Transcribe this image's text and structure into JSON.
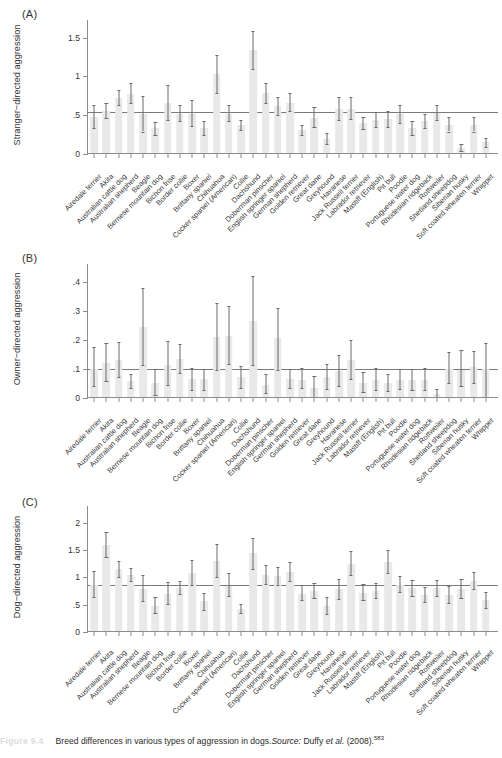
{
  "caption": {
    "figure_number": "Figure 9.4",
    "text_before_source": "Breed differences in various types of aggression in dogs.",
    "source_label": "Source:",
    "source_text": " Duffy ",
    "source_italic": "et al.",
    "source_year": " (2008).",
    "reference_number": "583"
  },
  "breeds": [
    "Airedale terrier",
    "Akita",
    "Australian cattle dog",
    "Australian shepherd",
    "Beagle",
    "Bernese mountain dog",
    "Bichon frise",
    "Border collie",
    "Boxer",
    "Brittany spaniel",
    "Chihuahua",
    "Cocker spaniel (American)",
    "Collie",
    "Dachshund",
    "Doberman pinscher",
    "English springer spaniel",
    "German shepherd",
    "Golden retriever",
    "Great dane",
    "Greyhound",
    "Havanese",
    "Jack Russell terrier",
    "Labrador retriever",
    "Mastiff (English)",
    "Pit bull",
    "Poodle",
    "Portuguese water dog",
    "Rhodesian ridgeback",
    "Rottweiler",
    "Shetland sheepdog",
    "Siberian husky",
    "Soft coated wheaten terrier",
    "Whippet"
  ],
  "chart_data": [
    {
      "type": "bar",
      "panel": "A",
      "panel_label": "(A)",
      "title": "",
      "ylabel": "Stranger−directed aggression",
      "xlabel": "",
      "ylim": [
        0,
        1.65
      ],
      "yticks": [
        0,
        0.5,
        1,
        1.5
      ],
      "ytick_labels": [
        "0",
        ".5",
        "1",
        "1.5"
      ],
      "grid": false,
      "legend": "none",
      "reference_line": 0.54,
      "categories": [
        "Airedale terrier",
        "Akita",
        "Australian cattle dog",
        "Australian shepherd",
        "Beagle",
        "Bernese mountain dog",
        "Bichon frise",
        "Border collie",
        "Boxer",
        "Brittany spaniel",
        "Chihuahua",
        "Cocker spaniel (American)",
        "Collie",
        "Dachshund",
        "Doberman pinscher",
        "English springer spaniel",
        "German shepherd",
        "Golden retriever",
        "Great dane",
        "Greyhound",
        "Havanese",
        "Jack Russell terrier",
        "Labrador retriever",
        "Mastiff (English)",
        "Pit bull",
        "Poodle",
        "Portuguese water dog",
        "Rhodesian ridgeback",
        "Rottweiler",
        "Shetland sheepdog",
        "Siberian husky",
        "Soft coated wheaten terrier",
        "Whippet"
      ],
      "values": [
        0.48,
        0.56,
        0.72,
        0.78,
        0.52,
        0.33,
        0.66,
        0.52,
        0.52,
        0.33,
        1.03,
        0.52,
        0.37,
        1.34,
        0.79,
        0.62,
        0.66,
        0.31,
        0.47,
        0.2,
        0.58,
        0.58,
        0.4,
        0.44,
        0.45,
        0.51,
        0.33,
        0.42,
        0.53,
        0.38,
        0.08,
        0.38,
        0.15
      ],
      "err_low": [
        0.34,
        0.46,
        0.63,
        0.66,
        0.29,
        0.24,
        0.44,
        0.42,
        0.36,
        0.24,
        0.78,
        0.42,
        0.31,
        1.1,
        0.66,
        0.5,
        0.55,
        0.24,
        0.35,
        0.13,
        0.44,
        0.45,
        0.32,
        0.35,
        0.35,
        0.4,
        0.24,
        0.33,
        0.44,
        0.29,
        0.04,
        0.29,
        0.09
      ],
      "err_high": [
        0.63,
        0.66,
        0.83,
        0.91,
        0.75,
        0.41,
        0.89,
        0.63,
        0.69,
        0.42,
        1.28,
        0.63,
        0.44,
        1.58,
        0.92,
        0.74,
        0.78,
        0.38,
        0.6,
        0.27,
        0.73,
        0.73,
        0.48,
        0.54,
        0.56,
        0.63,
        0.42,
        0.51,
        0.63,
        0.48,
        0.13,
        0.48,
        0.21
      ]
    },
    {
      "type": "bar",
      "panel": "B",
      "panel_label": "(B)",
      "title": "",
      "ylabel": "Owner−directed aggression",
      "xlabel": "",
      "ylim": [
        0,
        0.44
      ],
      "yticks": [
        0,
        0.1,
        0.2,
        0.3,
        0.4
      ],
      "ytick_labels": [
        "0",
        ".1",
        ".2",
        ".3",
        ".4"
      ],
      "grid": false,
      "legend": "none",
      "reference_line": 0.1,
      "categories": [
        "Airedale terrier",
        "Akita",
        "Australian cattle dog",
        "Australian shepherd",
        "Beagle",
        "Bernese mountain dog",
        "Bichon frise",
        "Border collie",
        "Boxer",
        "Brittany spaniel",
        "Chihuahua",
        "Cocker spaniel (American)",
        "Collie",
        "Dachshund",
        "Doberman pinscher",
        "English springer spaniel",
        "German shepherd",
        "Golden retriever",
        "Great dane",
        "Greyhound",
        "Havanese",
        "Jack Russell terrier",
        "Labrador retriever",
        "Mastiff (English)",
        "Pit bull",
        "Poodle",
        "Portuguese water dog",
        "Rhodesian ridgeback",
        "Rottweiler",
        "Shetland sheepdog",
        "Siberian husky",
        "Soft coated wheaten terrier",
        "Whippet"
      ],
      "values": [
        0.1,
        0.12,
        0.13,
        0.06,
        0.245,
        0.05,
        0.115,
        0.135,
        0.065,
        0.064,
        0.21,
        0.212,
        0.072,
        0.265,
        0.046,
        0.205,
        0.064,
        0.062,
        0.035,
        0.072,
        0.092,
        0.13,
        0.05,
        0.062,
        0.052,
        0.062,
        0.062,
        0.062,
        0.015,
        0.1,
        0.098,
        0.105,
        0.1
      ],
      "err_low": [
        0.042,
        0.06,
        0.073,
        0.035,
        0.115,
        0.01,
        0.043,
        0.086,
        0.028,
        0.027,
        0.095,
        0.118,
        0.034,
        0.112,
        0.017,
        0.096,
        0.035,
        0.033,
        0.004,
        0.031,
        0.042,
        0.066,
        0.02,
        0.029,
        0.024,
        0.03,
        0.028,
        0.028,
        0.004,
        0.053,
        0.042,
        0.052,
        0.002
      ],
      "err_high": [
        0.175,
        0.19,
        0.192,
        0.083,
        0.378,
        0.098,
        0.196,
        0.186,
        0.102,
        0.099,
        0.328,
        0.315,
        0.11,
        0.418,
        0.083,
        0.31,
        0.1,
        0.102,
        0.076,
        0.118,
        0.148,
        0.2,
        0.088,
        0.102,
        0.084,
        0.099,
        0.1,
        0.102,
        0.03,
        0.157,
        0.165,
        0.162,
        0.19
      ]
    },
    {
      "type": "bar",
      "panel": "C",
      "panel_label": "(C)",
      "title": "",
      "ylabel": "Dog−directed aggression",
      "xlabel": "",
      "ylim": [
        0,
        2.2
      ],
      "yticks": [
        0,
        0.5,
        1,
        1.5,
        2
      ],
      "ytick_labels": [
        "0",
        ".5",
        "1",
        "1.5",
        "2"
      ],
      "grid": false,
      "legend": "none",
      "reference_line": 0.86,
      "categories": [
        "Airedale terrier",
        "Akita",
        "Australian cattle dog",
        "Australian shepherd",
        "Beagle",
        "Bernese mountain dog",
        "Bichon frise",
        "Border collie",
        "Boxer",
        "Brittany spaniel",
        "Chihuahua",
        "Cocker spaniel (American)",
        "Collie",
        "Dachshund",
        "Doberman pinscher",
        "English springer spaniel",
        "German shepherd",
        "Golden retriever",
        "Great dane",
        "Greyhound",
        "Havanese",
        "Jack Russell terrier",
        "Labrador retriever",
        "Mastiff (English)",
        "Pit bull",
        "Poodle",
        "Portuguese water dog",
        "Rhodesian ridgeback",
        "Rottweiler",
        "Shetland sheepdog",
        "Siberian husky",
        "Soft coated wheaten terrier",
        "Whippet"
      ],
      "values": [
        0.87,
        1.6,
        1.15,
        1.05,
        0.78,
        0.48,
        0.7,
        0.8,
        1.08,
        0.57,
        1.3,
        0.85,
        0.43,
        1.44,
        1.05,
        1.03,
        1.1,
        0.7,
        0.75,
        0.48,
        0.78,
        1.25,
        0.72,
        0.75,
        1.28,
        0.87,
        0.8,
        0.68,
        0.8,
        0.68,
        0.78,
        0.93,
        0.58
      ],
      "err_low": [
        0.65,
        1.38,
        1.0,
        0.93,
        0.56,
        0.34,
        0.51,
        0.7,
        0.87,
        0.41,
        1.01,
        0.66,
        0.35,
        1.16,
        0.88,
        0.86,
        0.93,
        0.58,
        0.62,
        0.33,
        0.6,
        1.05,
        0.58,
        0.62,
        1.08,
        0.73,
        0.66,
        0.55,
        0.66,
        0.54,
        0.62,
        0.78,
        0.44
      ],
      "err_high": [
        1.12,
        1.83,
        1.3,
        1.18,
        1.04,
        0.64,
        0.92,
        0.93,
        1.32,
        0.72,
        1.62,
        1.08,
        0.52,
        1.72,
        1.22,
        1.2,
        1.28,
        0.86,
        0.9,
        0.65,
        0.98,
        1.48,
        0.88,
        0.9,
        1.5,
        1.02,
        0.95,
        0.82,
        0.95,
        0.84,
        0.97,
        1.1,
        0.74
      ]
    }
  ],
  "colors": {
    "bar_fill": "#e9e9e9",
    "error_bar": "#6b6b6b",
    "axis": "#8c8c8c",
    "reference_line": "#7a7a7a",
    "text": "#333333",
    "figure_number": "#dcdcdc"
  }
}
